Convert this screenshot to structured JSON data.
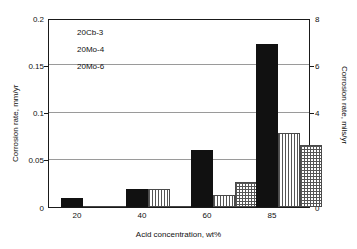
{
  "chart_data": {
    "type": "bar",
    "title": "",
    "xlabel": "Acid concentration, wt%",
    "ylabel": "Corrosion rate, mm/yr",
    "y2label": "Corrosion rate, mils/yr",
    "categories": [
      "20",
      "40",
      "60",
      "85"
    ],
    "ylim": [
      0,
      0.2
    ],
    "y2lim": [
      0,
      8
    ],
    "yticks": [
      "0",
      "0.05",
      "0.1",
      "0.15",
      "0.2"
    ],
    "ytick_values": [
      0,
      0.05,
      0.1,
      0.15,
      0.2
    ],
    "y2ticks": [
      "0",
      "2",
      "4",
      "6",
      "8"
    ],
    "y2tick_values": [
      0,
      2,
      4,
      6,
      8
    ],
    "grid": true,
    "gridlines_at": [
      0.05,
      0.1,
      0.15
    ],
    "legend_position": "top-left",
    "series": [
      {
        "name": "20Cb-3",
        "pattern": "solid",
        "values": [
          0.01,
          0.019,
          0.06,
          0.172
        ]
      },
      {
        "name": "20Mo-4",
        "pattern": "vertical-stripe",
        "values": [
          0.0005,
          0.019,
          0.013,
          0.078
        ]
      },
      {
        "name": "20Mo-6",
        "pattern": "crosshatch-grid",
        "values": [
          0.0005,
          0.0008,
          0.027,
          0.066
        ]
      }
    ]
  },
  "legend": {
    "items": [
      {
        "label": "20Cb-3"
      },
      {
        "label": "20Mo-4"
      },
      {
        "label": "20Mo-6"
      }
    ]
  },
  "colors": {
    "solid": "#111111",
    "pattern_line": "#555555",
    "frame": "#1a1a1a",
    "gridline": "#9a9a9a",
    "background": "#ffffff"
  }
}
